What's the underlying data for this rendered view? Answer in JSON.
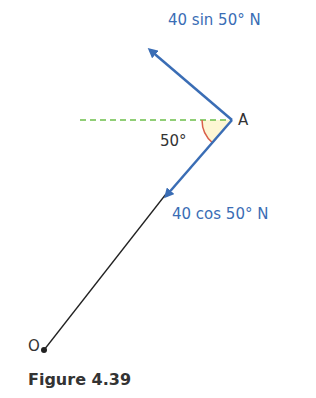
{
  "diagram": {
    "labels": {
      "force_up": "40 sin 50° N",
      "force_down": "40 cos 50° N",
      "point_a": "A",
      "point_o": "O",
      "angle": "50°"
    },
    "caption": "Figure 4.39",
    "colors": {
      "force_arrow": "#3a6db5",
      "dashed_line": "#6cbf4a",
      "angle_arc": "#d9604a",
      "angle_fill": "#fdf6d4",
      "rod": "#222222"
    }
  }
}
